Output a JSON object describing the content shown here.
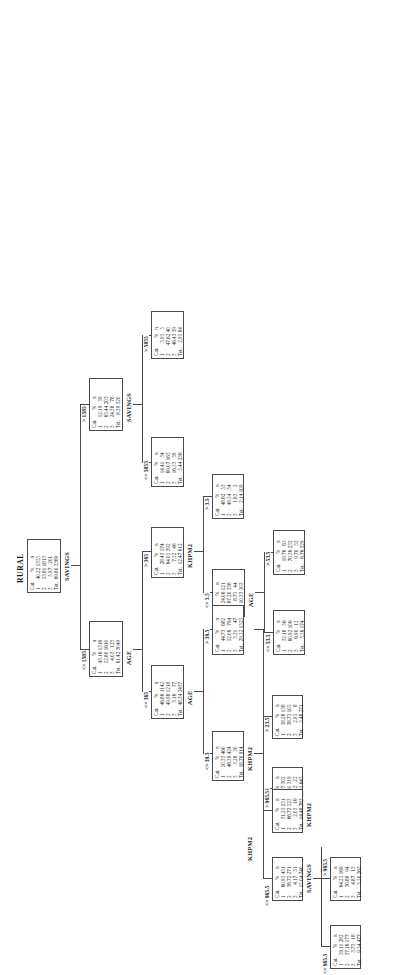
{
  "diagram": {
    "title": "RURAL",
    "type": "classification-tree",
    "columns": [
      "Cat.",
      "%",
      "n"
    ],
    "total_label": "Tot."
  },
  "nodes": {
    "root": {
      "id": "root",
      "label": "RURAL",
      "split_variable": "SAVINGS",
      "rows": [
        {
          "cat": "1",
          "pct": "40.22",
          "n": "1355"
        },
        {
          "cat": "2",
          "pct": "53.81",
          "n": "1813"
        },
        {
          "cat": "3",
          "pct": "5.97",
          "n": "201"
        },
        {
          "cat": "Tot.",
          "pct": "69.80",
          "n": "3369"
        }
      ]
    },
    "sav_le1585": {
      "id": "sav_le1585",
      "edge": "<= 1585",
      "split_variable": "AGE",
      "rows": [
        {
          "cat": "1",
          "pct": "43.16",
          "n": "1316"
        },
        {
          "cat": "2",
          "pct": "52.80",
          "n": "1610"
        },
        {
          "cat": "3",
          "pct": "4.03",
          "n": "123"
        },
        {
          "cat": "Tot.",
          "pct": "61.42",
          "n": "3049"
        }
      ]
    },
    "sav_gt1585": {
      "id": "sav_gt1585",
      "edge": "> 1585",
      "split_variable": "SAVINGS",
      "rows": [
        {
          "cat": "1",
          "pct": "12.19",
          "n": "39"
        },
        {
          "cat": "2",
          "pct": "63.44",
          "n": "203"
        },
        {
          "cat": "3",
          "pct": "24.38",
          "n": "78"
        },
        {
          "cat": "Tot.",
          "pct": "8.39",
          "n": "320"
        }
      ]
    },
    "sav_le5855": {
      "id": "sav_le5855",
      "edge": "<= 5855",
      "split_variable": "",
      "rows": [
        {
          "cat": "1",
          "pct": "14.41",
          "n": "34"
        },
        {
          "cat": "2",
          "pct": "69.07",
          "n": "163"
        },
        {
          "cat": "3",
          "pct": "16.53",
          "n": "39"
        },
        {
          "cat": "Tot.",
          "pct": "5.44",
          "n": "236"
        }
      ]
    },
    "sav_gt5855": {
      "id": "sav_gt5855",
      "edge": "> 5855",
      "split_variable": "",
      "rows": [
        {
          "cat": "1",
          "pct": "5.95",
          "n": "5"
        },
        {
          "cat": "2",
          "pct": "47.62",
          "n": "40"
        },
        {
          "cat": "3",
          "pct": "46.43",
          "n": "39"
        },
        {
          "cat": "Tot.",
          "pct": "2.95",
          "n": "84"
        }
      ]
    },
    "age_le365": {
      "id": "age_le365",
      "edge": "<= 365",
      "split_variable": "AGE",
      "rows": [
        {
          "cat": "1",
          "pct": "46.86",
          "n": "1142"
        },
        {
          "cat": "2",
          "pct": "49.98",
          "n": "1218"
        },
        {
          "cat": "3",
          "pct": "3.16",
          "n": "77"
        },
        {
          "cat": "Tot.",
          "pct": "48.34",
          "n": "2437"
        }
      ]
    },
    "age_gt365": {
      "id": "age_gt365",
      "edge": "> 365",
      "split_variable": "KHPM2",
      "rows": [
        {
          "cat": "1",
          "pct": "28.43",
          "n": "174"
        },
        {
          "cat": "2",
          "pct": "64.05",
          "n": "392"
        },
        {
          "cat": "3",
          "pct": "7.52",
          "n": "46"
        },
        {
          "cat": "Tot.",
          "pct": "12.47",
          "n": "612"
        }
      ]
    },
    "khpm2_le35": {
      "id": "khpm2_le35",
      "edge": "<= 3.5",
      "split_variable": "AGE",
      "rows": [
        {
          "cat": "1",
          "pct": "24.06",
          "n": "121"
        },
        {
          "cat": "2",
          "pct": "67.20",
          "n": "338"
        },
        {
          "cat": "3",
          "pct": "8.75",
          "n": "44"
        },
        {
          "cat": "Tot.",
          "pct": "10.33",
          "n": "503"
        }
      ]
    },
    "khpm2_gt35": {
      "id": "khpm2_gt35",
      "edge": "> 3.5",
      "split_variable": "",
      "rows": [
        {
          "cat": "1",
          "pct": "48.62",
          "n": "53"
        },
        {
          "cat": "2",
          "pct": "49.54",
          "n": "54"
        },
        {
          "cat": "3",
          "pct": "1.83",
          "n": "2"
        },
        {
          "cat": "Tot.",
          "pct": "2.14",
          "n": "109"
        }
      ]
    },
    "age_le535": {
      "id": "age_le535",
      "edge": "<= 53.5",
      "split_variable": "",
      "rows": [
        {
          "cat": "1",
          "pct": "32.18",
          "n": "56"
        },
        {
          "cat": "2",
          "pct": "60.92",
          "n": "106"
        },
        {
          "cat": "3",
          "pct": "6.90",
          "n": "12"
        },
        {
          "cat": "Tot.",
          "pct": "3.56",
          "n": "174"
        }
      ]
    },
    "age_gt535": {
      "id": "age_gt535",
      "edge": "> 53.5",
      "split_variable": "",
      "rows": [
        {
          "cat": "1",
          "pct": "19.76",
          "n": "65"
        },
        {
          "cat": "2",
          "pct": "70.36",
          "n": "232"
        },
        {
          "cat": "3",
          "pct": "9.70",
          "n": "32"
        },
        {
          "cat": "Tot.",
          "pct": "6.76",
          "n": "329"
        }
      ]
    },
    "age_le395": {
      "id": "age_le395",
      "edge": "<= 39.5",
      "split_variable": "KHPM2",
      "rows": [
        {
          "cat": "1",
          "pct": "50.33",
          "n": "460"
        },
        {
          "cat": "2",
          "pct": "46.39",
          "n": "424"
        },
        {
          "cat": "3",
          "pct": "3.28",
          "n": "30"
        },
        {
          "cat": "Tot.",
          "pct": "18.70",
          "n": "914"
        }
      ]
    },
    "age_gt395": {
      "id": "age_gt395",
      "edge": "> 39.5",
      "split_variable": "KHPM2",
      "rows": [
        {
          "cat": "1",
          "pct": "44.73",
          "n": "682"
        },
        {
          "cat": "2",
          "pct": "52.06",
          "n": "794"
        },
        {
          "cat": "3",
          "pct": "3.21",
          "n": "47"
        },
        {
          "cat": "Tot.",
          "pct": "29.52",
          "n": "1523"
        }
      ]
    },
    "k2_le235": {
      "id": "k2_le235",
      "edge": "<= 23.5",
      "split_variable": "",
      "rows": [
        {
          "cat": "1",
          "pct": "46.97",
          "n": "302"
        },
        {
          "cat": "2",
          "pct": "49.61",
          "n": "319"
        },
        {
          "cat": "3",
          "pct": "3.42",
          "n": "22"
        },
        {
          "cat": "Tot.",
          "pct": "12.45",
          "n": "643"
        }
      ]
    },
    "k2_gt235": {
      "id": "k2_gt235",
      "edge": "> 23.5",
      "split_variable": "",
      "rows": [
        {
          "cat": "1",
          "pct": "58.28",
          "n": "158"
        },
        {
          "cat": "2",
          "pct": "38.75",
          "n": "105"
        },
        {
          "cat": "3",
          "pct": "2.95",
          "n": "8"
        },
        {
          "cat": "Tot.",
          "pct": "5.48",
          "n": "271"
        }
      ]
    },
    "k2_le9655": {
      "id": "k2_le9655",
      "edge": "<= 965.5",
      "split_variable": "SAVINGS",
      "rows": [
        {
          "cat": "1",
          "pct": "60.95",
          "n": "451"
        },
        {
          "cat": "2",
          "pct": "36.72",
          "n": "271"
        },
        {
          "cat": "3",
          "pct": "4.17",
          "n": "31"
        },
        {
          "cat": "Tot.",
          "pct": "15.04",
          "n": "740"
        }
      ]
    },
    "k2_gt9655": {
      "id": "k2_gt9655",
      "edge": "> 965.5",
      "split_variable": "KHPM2",
      "rows": [
        {
          "cat": "1",
          "pct": "31.25",
          "n": "231"
        },
        {
          "cat": "2",
          "pct": "66.72",
          "n": "523"
        },
        {
          "cat": "3",
          "pct": "2.03",
          "n": "16"
        },
        {
          "cat": "Tot.",
          "pct": "14.48",
          "n": "783"
        }
      ]
    },
    "sav_le9655_a": {
      "id": "sav_le9655_a",
      "edge": "<= 965.5",
      "split_variable": "",
      "rows": [
        {
          "cat": "1",
          "pct": "59.11",
          "n": "282"
        },
        {
          "cat": "2",
          "pct": "37.16",
          "n": "177"
        },
        {
          "cat": "3",
          "pct": "3.73",
          "n": "18"
        },
        {
          "cat": "Tot.",
          "pct": "9.54",
          "n": "477"
        }
      ]
    },
    "sav_gt9655_b": {
      "id": "sav_gt9655_b",
      "edge": "> 965.5",
      "split_variable": "",
      "rows": [
        {
          "cat": "1",
          "pct": "64.25",
          "n": "169"
        },
        {
          "cat": "2",
          "pct": "30.88",
          "n": "94"
        },
        {
          "cat": "3",
          "pct": "4.87",
          "n": "13"
        },
        {
          "cat": "Tot.",
          "pct": "5.50",
          "n": "263"
        }
      ]
    }
  }
}
